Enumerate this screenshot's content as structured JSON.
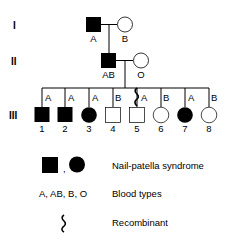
{
  "generations": [
    {
      "label": "I",
      "members": [
        {
          "sex": "male",
          "affected": true,
          "blood_type": "A"
        },
        {
          "sex": "female",
          "affected": false,
          "blood_type": "B"
        }
      ]
    },
    {
      "label": "II",
      "members": [
        {
          "sex": "male",
          "affected": true,
          "blood_type": "AB"
        },
        {
          "sex": "female",
          "affected": false,
          "blood_type": "O"
        }
      ]
    },
    {
      "label": "III",
      "members": [
        {
          "number": "1",
          "sex": "male",
          "affected": true,
          "blood_type": "A",
          "recombinant": false
        },
        {
          "number": "2",
          "sex": "male",
          "affected": true,
          "blood_type": "A",
          "recombinant": false
        },
        {
          "number": "3",
          "sex": "female",
          "affected": true,
          "blood_type": "A",
          "recombinant": false
        },
        {
          "number": "4",
          "sex": "male",
          "affected": false,
          "blood_type": "B",
          "recombinant": false
        },
        {
          "number": "5",
          "sex": "male",
          "affected": false,
          "blood_type": "A",
          "recombinant": true
        },
        {
          "number": "6",
          "sex": "female",
          "affected": false,
          "blood_type": "B",
          "recombinant": false
        },
        {
          "number": "7",
          "sex": "female",
          "affected": true,
          "blood_type": "A",
          "recombinant": false
        },
        {
          "number": "8",
          "sex": "female",
          "affected": false,
          "blood_type": "B",
          "recombinant": false
        }
      ]
    }
  ],
  "legend": {
    "affected_separator": ",",
    "affected_label": "Nail-patella syndrome",
    "blood_symbols": "A, AB, B, O",
    "blood_label": "Blood types",
    "recombinant_label": "Recombinant"
  },
  "colors": {
    "affected": "#000000",
    "unaffected": "#ffffff",
    "line": "#000000"
  }
}
